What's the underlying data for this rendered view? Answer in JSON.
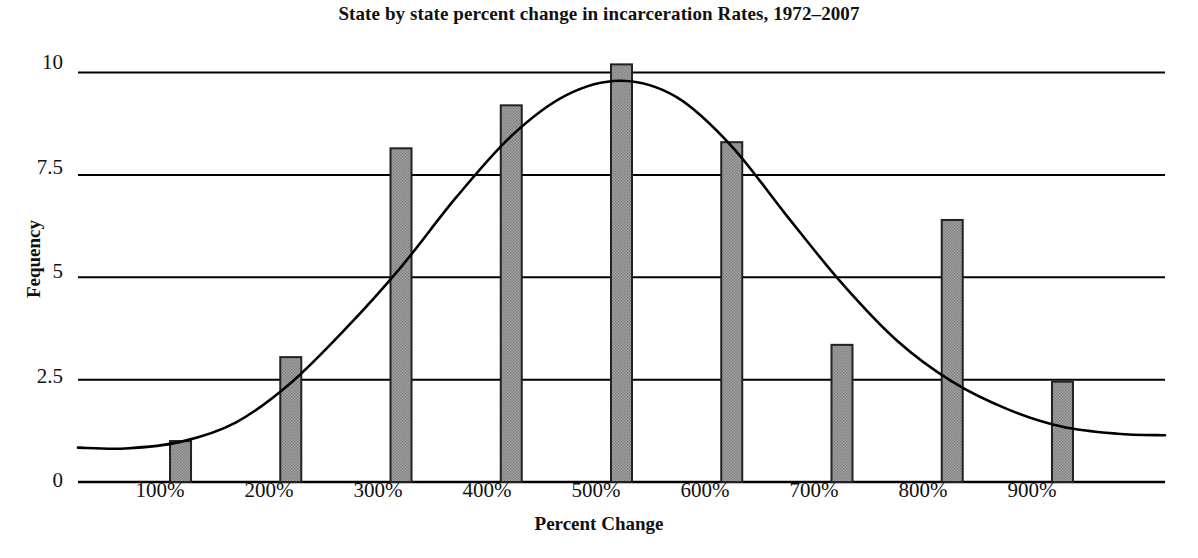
{
  "chart_data": {
    "type": "bar",
    "title": "State by state percent change in incarceration Rates, 1972–2007",
    "xlabel": "Percent Change",
    "ylabel": "Fequency",
    "categories": [
      "100%",
      "200%",
      "300%",
      "400%",
      "500%",
      "600%",
      "700%",
      "800%",
      "900%"
    ],
    "values": [
      1.0,
      3.05,
      8.15,
      9.2,
      10.2,
      8.3,
      3.35,
      6.4,
      2.45
    ],
    "ylim": [
      0,
      10.6
    ],
    "yticks": [
      0,
      2.5,
      5,
      7.5,
      10
    ],
    "ytick_labels": [
      "0",
      "2.5",
      "5",
      "7.5",
      "10"
    ],
    "grid": true,
    "legend": "none",
    "bar_color": "#9a9a9a",
    "bar_edge_color": "#222222",
    "grid_color": "#000000",
    "overlay": {
      "type": "line",
      "name": "normal-distribution-curve",
      "description": "smooth bell curve fitted over the histogram",
      "color": "#000000",
      "peak_x": "500%",
      "peak_y": 9.8,
      "points": [
        {
          "x": 50,
          "y": 0.82
        },
        {
          "x": 100,
          "y": 0.98
        },
        {
          "x": 150,
          "y": 1.45
        },
        {
          "x": 200,
          "y": 2.42
        },
        {
          "x": 250,
          "y": 3.75
        },
        {
          "x": 300,
          "y": 5.25
        },
        {
          "x": 350,
          "y": 6.95
        },
        {
          "x": 400,
          "y": 8.45
        },
        {
          "x": 450,
          "y": 9.45
        },
        {
          "x": 500,
          "y": 9.8
        },
        {
          "x": 550,
          "y": 9.4
        },
        {
          "x": 600,
          "y": 8.2
        },
        {
          "x": 650,
          "y": 6.5
        },
        {
          "x": 700,
          "y": 4.85
        },
        {
          "x": 750,
          "y": 3.45
        },
        {
          "x": 800,
          "y": 2.45
        },
        {
          "x": 850,
          "y": 1.78
        },
        {
          "x": 900,
          "y": 1.35
        },
        {
          "x": 950,
          "y": 1.18
        }
      ]
    }
  }
}
